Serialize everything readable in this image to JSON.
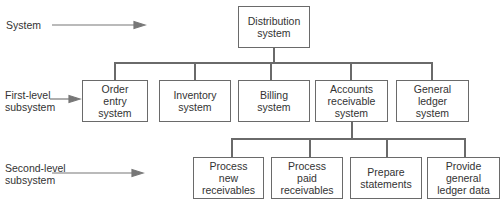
{
  "levels": {
    "system": "System",
    "first": "First-level\nsubsystem",
    "second": "Second-level\nsubsystem"
  },
  "root": {
    "label": "Distribution\nsystem"
  },
  "first_level": [
    {
      "label": "Order\nentry\nsystem"
    },
    {
      "label": "Inventory\nsystem"
    },
    {
      "label": "Billing\nsystem"
    },
    {
      "label": "Accounts\nreceivable\nsystem"
    },
    {
      "label": "General\nledger\nsystem"
    }
  ],
  "second_level": [
    {
      "label": "Process\nnew\nreceivables"
    },
    {
      "label": "Process\npaid\nreceivables"
    },
    {
      "label": "Prepare\nstatements"
    },
    {
      "label": "Provide\ngeneral\nledger data"
    }
  ],
  "colors": {
    "line": "#6a6a6a",
    "text": "#333333",
    "arrow": "#777777"
  }
}
